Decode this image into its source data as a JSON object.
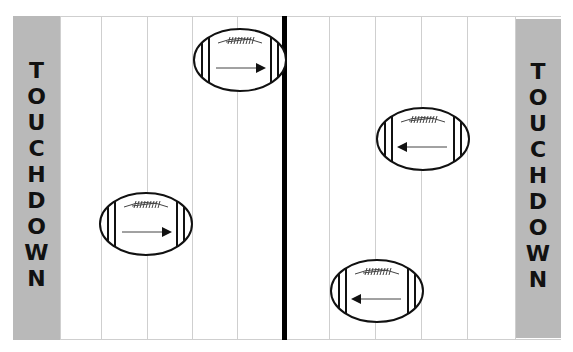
{
  "field": {
    "endzone_left": {
      "label": "TOUCHDOWN",
      "color": "#b9b9b9"
    },
    "endzone_right": {
      "label": "TOUCHDOWN",
      "color": "#b9b9b9"
    },
    "yard_lines_x": [
      60,
      101,
      147,
      192,
      237,
      329,
      375,
      421,
      467,
      515
    ],
    "midline_x": 284
  },
  "footballs": [
    {
      "id": 1,
      "cx": 240,
      "cy": 60,
      "direction": "right"
    },
    {
      "id": 2,
      "cx": 146,
      "cy": 224,
      "direction": "right"
    },
    {
      "id": 3,
      "cx": 423,
      "cy": 139,
      "direction": "left"
    },
    {
      "id": 4,
      "cx": 377,
      "cy": 291,
      "direction": "left"
    }
  ],
  "icons": {
    "football": "football-icon",
    "arrow": "arrow-icon"
  }
}
